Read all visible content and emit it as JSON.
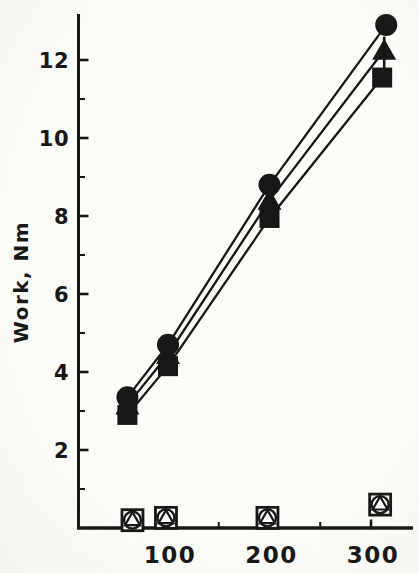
{
  "figure": {
    "ink_color": "#171717",
    "background_color": "#fcfcf9"
  },
  "chart_data": {
    "type": "line",
    "title": "",
    "xlabel": "",
    "ylabel": "Work, Nm",
    "x_ticks": [
      100,
      200,
      300
    ],
    "x_minor_ticks": [
      150,
      250
    ],
    "y_ticks": [
      2,
      4,
      6,
      8,
      10,
      12
    ],
    "y_minor_ticks": [
      1,
      3,
      5,
      7,
      9,
      11
    ],
    "x_range_shown": [
      11,
      340
    ],
    "y_range_shown": [
      0,
      13.2
    ],
    "grid": false,
    "legend": "none",
    "series": [
      {
        "name": "filled-triangle",
        "marker": "filled-triangle",
        "line": true,
        "x": [
          60,
          100,
          200,
          313
        ],
        "y": [
          3.15,
          4.45,
          8.4,
          12.25
        ],
        "error_bars": [
          {
            "index": 3,
            "plus": 0.35,
            "minus": 0.5
          }
        ]
      },
      {
        "name": "filled-square",
        "marker": "filled-square",
        "line": true,
        "x": [
          60,
          100,
          200,
          311
        ],
        "y": [
          2.9,
          4.15,
          7.95,
          11.55
        ]
      },
      {
        "name": "filled-circle",
        "marker": "filled-circle",
        "line": true,
        "x": [
          60,
          100,
          200,
          315
        ],
        "y": [
          3.35,
          4.7,
          8.8,
          12.9
        ]
      },
      {
        "name": "open-square",
        "marker": "open-square",
        "line": false,
        "x": [
          65,
          98,
          198,
          309
        ],
        "y": [
          0.2,
          0.26,
          0.26,
          0.6
        ]
      },
      {
        "name": "open-circle",
        "marker": "open-circle",
        "line": false,
        "x": [
          65,
          98,
          198,
          309
        ],
        "y": [
          0.2,
          0.26,
          0.26,
          0.6
        ]
      },
      {
        "name": "open-triangle",
        "marker": "open-triangle",
        "line": false,
        "x": [
          65,
          98,
          198,
          309
        ],
        "y": [
          0.25,
          0.3,
          0.3,
          0.65
        ]
      }
    ]
  }
}
